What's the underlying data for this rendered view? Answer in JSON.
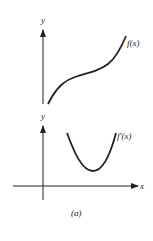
{
  "figure": {
    "caption": "(a)",
    "stroke_color": "#222222",
    "background": "#ffffff"
  },
  "top_panel": {
    "y_axis_label": "y",
    "curve_label": "f(x)",
    "description": "increasing S-shaped curve (concave down then concave up)"
  },
  "bottom_panel": {
    "y_axis_label": "y",
    "x_axis_label": "x",
    "curve_label": "f′(x)",
    "description": "U-shaped curve with positive minimum, above x-axis"
  }
}
